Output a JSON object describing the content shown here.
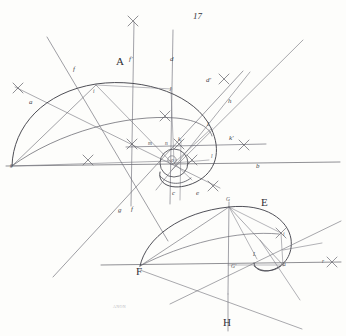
{
  "plate": {
    "page_number": "17",
    "engraver_signature": "ANON",
    "paper_color": "#fdfdfb",
    "ink_color": "#55555c",
    "label_color": "#3b3b41"
  },
  "figures": [
    {
      "name": "figure-A",
      "label": "A",
      "x": 116,
      "y": 58
    },
    {
      "name": "figure-E",
      "label": "E",
      "x": 261,
      "y": 198
    }
  ],
  "labels_upper": [
    {
      "name": "label-f-upper-left",
      "text": "f",
      "x": 73,
      "y": 67,
      "cls": "lbl-min"
    },
    {
      "name": "label-a",
      "text": "a",
      "x": 29,
      "y": 100,
      "cls": "lbl-min"
    },
    {
      "name": "label-f-prime",
      "text": "f'",
      "x": 129,
      "y": 57,
      "cls": "lbl-min"
    },
    {
      "name": "label-d",
      "text": "d",
      "x": 170,
      "y": 57,
      "cls": "lbl-min"
    },
    {
      "name": "label-i",
      "text": "i",
      "x": 94,
      "y": 91,
      "cls": "lbl-tiny"
    },
    {
      "name": "label-j",
      "text": "J",
      "x": 169,
      "y": 89,
      "cls": "lbl-tiny"
    },
    {
      "name": "label-d-prime",
      "text": "d'",
      "x": 206,
      "y": 79,
      "cls": "lbl-min"
    },
    {
      "name": "label-h",
      "text": "h",
      "x": 228,
      "y": 99,
      "cls": "lbl-min"
    },
    {
      "name": "label-L-upper",
      "text": "L",
      "x": 207,
      "y": 124,
      "cls": "lbl-tiny"
    },
    {
      "name": "label-k-prime",
      "text": "k'",
      "x": 229,
      "y": 137,
      "cls": "lbl-min"
    },
    {
      "name": "label-l",
      "text": "l",
      "x": 211,
      "y": 156,
      "cls": "lbl-tiny"
    },
    {
      "name": "label-b",
      "text": "b",
      "x": 256,
      "y": 165,
      "cls": "lbl-min"
    },
    {
      "name": "label-m",
      "text": "m",
      "x": 149,
      "y": 142,
      "cls": "lbl-tiny"
    },
    {
      "name": "label-n",
      "text": "n",
      "x": 165,
      "y": 142,
      "cls": "lbl-tiny"
    },
    {
      "name": "label-k",
      "text": "k",
      "x": 178,
      "y": 139,
      "cls": "lbl-tiny"
    },
    {
      "name": "label-o",
      "text": "o",
      "x": 172,
      "y": 160,
      "cls": "lbl-tiny"
    },
    {
      "name": "label-g-origin",
      "text": "g",
      "x": 11,
      "y": 164,
      "cls": "lbl-tiny"
    },
    {
      "name": "label-g-lower",
      "text": "g",
      "x": 119,
      "y": 209,
      "cls": "lbl-min"
    },
    {
      "name": "label-f-lower",
      "text": "f",
      "x": 132,
      "y": 208,
      "cls": "lbl-min"
    },
    {
      "name": "label-c",
      "text": "c",
      "x": 172,
      "y": 192,
      "cls": "lbl-min"
    },
    {
      "name": "label-e",
      "text": "e",
      "x": 196,
      "y": 192,
      "cls": "lbl-min"
    }
  ],
  "labels_lower": [
    {
      "name": "label-G",
      "text": "G",
      "x": 226,
      "y": 199,
      "cls": "lbl-tiny"
    },
    {
      "name": "label-F",
      "text": "F",
      "x": 137,
      "y": 267,
      "cls": "lbl-cap"
    },
    {
      "name": "label-G-prime",
      "text": "G'",
      "x": 232,
      "y": 265,
      "cls": "lbl-tiny"
    },
    {
      "name": "label-L-lower",
      "text": "L",
      "x": 254,
      "y": 254,
      "cls": "lbl-tiny"
    },
    {
      "name": "label-a-lower",
      "text": "a",
      "x": 283,
      "y": 263,
      "cls": "lbl-tiny"
    },
    {
      "name": "label-i-lower",
      "text": "i",
      "x": 283,
      "y": 234,
      "cls": "lbl-tiny"
    },
    {
      "name": "label-r",
      "text": "r",
      "x": 323,
      "y": 260,
      "cls": "lbl-tiny"
    },
    {
      "name": "label-H",
      "text": "H",
      "x": 224,
      "y": 318,
      "cls": "lbl-cap"
    }
  ],
  "geometry": {
    "upper": {
      "baseline": {
        "x1": 6,
        "y1": 166,
        "x2": 340,
        "y2": 162
      },
      "vertical_f_prime": {
        "x1": 133,
        "y1": 22,
        "x2": 131,
        "y2": 205
      },
      "vertical_d": {
        "x1": 172,
        "y1": 30,
        "x2": 170,
        "y2": 203
      },
      "horizontal_k": {
        "x1": 126,
        "y1": 147,
        "x2": 264,
        "y2": 144
      },
      "ray_f": {
        "x1": 47,
        "y1": 38,
        "x2": 166,
        "y2": 238
      },
      "ray_a": {
        "x1": 16,
        "y1": 88,
        "x2": 218,
        "y2": 187
      },
      "ray_g": {
        "x1": 55,
        "y1": 275,
        "x2": 240,
        "y2": 74
      },
      "ray_h": {
        "x1": 176,
        "y1": 164,
        "x2": 300,
        "y2": 42
      },
      "ray_dprime": {
        "x1": 160,
        "y1": 184,
        "x2": 252,
        "y2": 74
      },
      "chord_gi": {
        "x1": 12,
        "y1": 165,
        "x2": 96,
        "y2": 84
      },
      "chord_gJ": {
        "x1": 12,
        "y1": 165,
        "x2": 215,
        "y2": 140
      },
      "oval_small_cx": 174,
      "oval_small_cy": 163,
      "oval_small_r": 14
    },
    "lower": {
      "baseline": {
        "x1": 102,
        "y1": 265,
        "x2": 340,
        "y2": 262
      },
      "vertical_G": {
        "x1": 229,
        "y1": 203,
        "x2": 228,
        "y2": 292
      },
      "vertical_H": {
        "x1": 228,
        "y1": 292,
        "x2": 228,
        "y2": 330
      },
      "ray_left": {
        "x1": 172,
        "y1": 302,
        "x2": 340,
        "y2": 222
      },
      "ray_cross": {
        "x1": 140,
        "y1": 271,
        "x2": 300,
        "y2": 328
      }
    }
  }
}
